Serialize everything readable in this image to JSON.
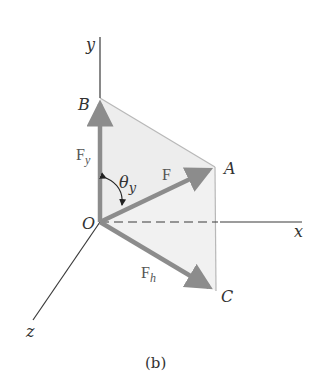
{
  "figure": {
    "caption": "(b)",
    "colors": {
      "axis": "#3a3a3a",
      "arrow": "#8c8c8c",
      "plane_fill": "#ededed",
      "plane_edge": "#b8b8b8",
      "label": "#333333"
    },
    "points": {
      "O": {
        "label": "O",
        "x": 100,
        "y": 222
      },
      "B": {
        "label": "B",
        "x": 100,
        "y": 98
      },
      "A": {
        "label": "A",
        "x": 215,
        "y": 167
      },
      "C": {
        "label": "C",
        "x": 216,
        "y": 291
      }
    },
    "axes": {
      "x": {
        "label": "x"
      },
      "y": {
        "label": "y"
      },
      "z": {
        "label": "z"
      }
    },
    "vectors": {
      "F": {
        "label": "F",
        "sub": ""
      },
      "Fy": {
        "label": "F",
        "sub": "y"
      },
      "Fh": {
        "label": "F",
        "sub": "h"
      }
    },
    "angle": {
      "symbol": "θ",
      "sub": "y"
    }
  }
}
